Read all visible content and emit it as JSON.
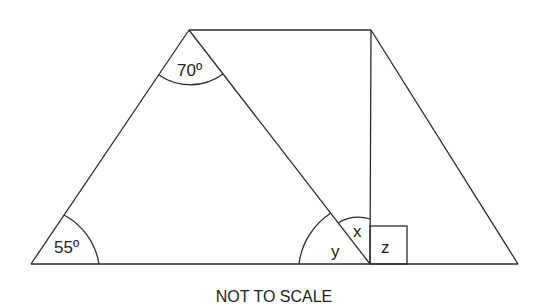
{
  "diagram": {
    "type": "geometry",
    "angles": {
      "bottom_left": "55º",
      "apex": "70º",
      "x_label": "x",
      "y_label": "y",
      "z_label": "z"
    },
    "right_angle_marker": true,
    "caption": "NOT TO SCALE"
  }
}
